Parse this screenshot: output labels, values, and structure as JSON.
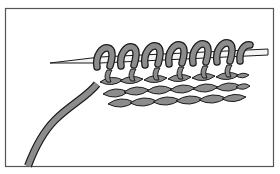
{
  "illustration": {
    "subject": "knitting needle with stitches and working yarn",
    "colors": {
      "background": "#ffffff",
      "frame": "#555555",
      "outline": "#1a1a1a",
      "yarn": "#8c8c8c",
      "needle": "#f4f4f4"
    },
    "needle_loops_count": 7,
    "stitch_rows_count": 3
  }
}
